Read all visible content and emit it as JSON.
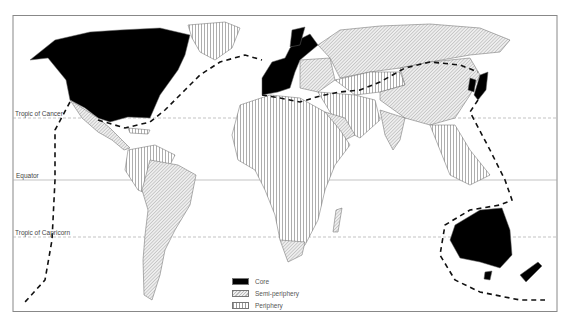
{
  "map": {
    "type": "world map",
    "theme": "World-systems: core, semi-periphery, periphery",
    "reference_lines": [
      {
        "label": "Tropic of Cancer",
        "style": "dashed"
      },
      {
        "label": "Equator",
        "style": "solid"
      },
      {
        "label": "Tropic of Capricorn",
        "style": "dashed"
      }
    ],
    "boundary_line": {
      "style": "thick dashed",
      "meaning": "North–South divide"
    }
  },
  "labels": {
    "tropic_cancer": "Tropic of Cancer",
    "equator": "Equator",
    "tropic_capricorn": "Tropic of Capricorn"
  },
  "legend": {
    "items": [
      {
        "label": "Core",
        "fill": "solid black"
      },
      {
        "label": "Semi-periphery",
        "fill": "diagonal hatch"
      },
      {
        "label": "Periphery",
        "fill": "vertical hatch"
      }
    ]
  },
  "colors": {
    "core": "#000000",
    "frame": "#777777",
    "lines": "#999999"
  }
}
